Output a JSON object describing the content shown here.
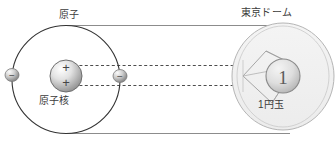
{
  "diagram": {
    "title_left": "原子",
    "title_right": "東京ドーム",
    "label_nucleus": "原子核",
    "label_coin": "1円玉",
    "coin_face_value": "1",
    "nucleus_charge_top": "+",
    "nucleus_charge_bottom": "+",
    "electron_left_charge": "−",
    "electron_right_charge": "−",
    "colors": {
      "outline": "#333333",
      "guide_line": "#8c8c8c",
      "dashed_line": "#4d4d4d",
      "dome_fill": "#f0f0f0",
      "dome_stroke": "#b5b5b5",
      "sphere_light": "#fdfdfd",
      "sphere_dark": "#8e8e8e",
      "text": "#3b3b3b"
    }
  }
}
